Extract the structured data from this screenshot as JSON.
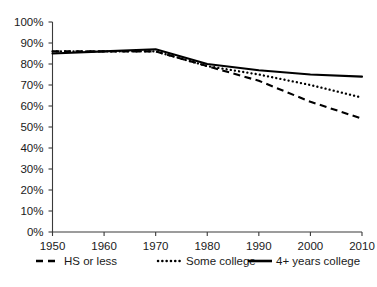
{
  "chart_data": {
    "type": "line",
    "title": "",
    "subtitle": "",
    "xlabel": "",
    "ylabel": "",
    "xlim": [
      1950,
      2010
    ],
    "ylim": [
      0,
      100
    ],
    "grid": false,
    "legend_position": "bottom",
    "x": [
      1950,
      1960,
      1970,
      1980,
      1990,
      2000,
      2010
    ],
    "xtick_labels": [
      "1950",
      "1960",
      "1970",
      "1980",
      "1990",
      "2000",
      "2010"
    ],
    "ytick_labels": [
      "0%",
      "10%",
      "20%",
      "30%",
      "40%",
      "50%",
      "60%",
      "70%",
      "80%",
      "90%",
      "100%"
    ],
    "ytick_values": [
      0,
      10,
      20,
      30,
      40,
      50,
      60,
      70,
      80,
      90,
      100
    ],
    "series": [
      {
        "name": "HS or less",
        "style": "dashed",
        "color": "#000000",
        "values": [
          86,
          86,
          86,
          79,
          72,
          62,
          54
        ]
      },
      {
        "name": "Some college",
        "style": "dotted",
        "color": "#000000",
        "values": [
          86,
          86,
          86,
          79,
          75,
          70,
          64
        ]
      },
      {
        "name": "4+ years college",
        "style": "solid",
        "color": "#000000",
        "values": [
          85,
          86,
          87,
          80,
          77,
          75,
          74
        ]
      }
    ]
  },
  "legend": {
    "items": [
      {
        "label": "HS or less",
        "style": "dashed"
      },
      {
        "label": "Some college",
        "style": "dotted"
      },
      {
        "label": "4+ years college",
        "style": "solid"
      }
    ]
  },
  "colors": {
    "ink": "#000000",
    "axis": "#3a3a3a",
    "background": "#ffffff"
  }
}
